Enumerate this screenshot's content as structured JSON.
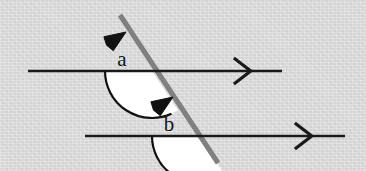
{
  "figure": {
    "background_color": "#d9d9d9",
    "line_color": "#1a1a1a",
    "transversal_color": "#808080",
    "sector_fill_color": "#ffffff",
    "arc_color": "#111111",
    "label_color": "#151515"
  },
  "parallel_lines": [
    {
      "name": "upper-parallel-line",
      "x1": 28,
      "y1": 71,
      "x2": 282,
      "y2": 71,
      "marker": {
        "name": "chevron-marker-icon",
        "glyph": ">",
        "x": 244,
        "y": 71,
        "size": 13
      }
    },
    {
      "name": "lower-parallel-line",
      "x1": 85,
      "y1": 136,
      "x2": 345,
      "y2": 136,
      "marker": {
        "name": "chevron-marker-icon",
        "glyph": ">",
        "x": 305,
        "y": 136,
        "size": 13
      }
    }
  ],
  "transversal": {
    "name": "transversal-line",
    "x1": 120,
    "y1": 15,
    "x2": 218,
    "y2": 163,
    "width": 5
  },
  "intersections": [
    {
      "name": "upper-intersection-point",
      "x": 152,
      "y": 71
    },
    {
      "name": "lower-intersection-point",
      "x": 199,
      "y": 136
    }
  ],
  "angles": [
    {
      "name": "angle-a",
      "label": "a",
      "vertex_x": 152,
      "vertex_y": 71,
      "radius": 47,
      "start_angle_deg": 180,
      "end_angle_deg": 303.5,
      "label_x": 122,
      "label_y": 66,
      "arrowhead": {
        "name": "angle-a-arrowhead-icon",
        "x": 126,
        "y": 32,
        "rotation_deg": -34
      }
    },
    {
      "name": "angle-b",
      "label": "b",
      "vertex_x": 199,
      "vertex_y": 136,
      "radius": 47,
      "start_angle_deg": 180,
      "end_angle_deg": 303.5,
      "label_x": 169,
      "label_y": 131,
      "arrowhead": {
        "name": "angle-b-arrowhead-icon",
        "x": 173,
        "y": 97,
        "rotation_deg": -34
      }
    }
  ],
  "chart_data": {
    "type": "diagram",
    "annotations": [
      "a",
      "b"
    ],
    "labels": [
      "a",
      "b"
    ],
    "angle_values_deg": [
      123.5,
      123.5
    ],
    "relationship": "corresponding angles (equal)"
  }
}
